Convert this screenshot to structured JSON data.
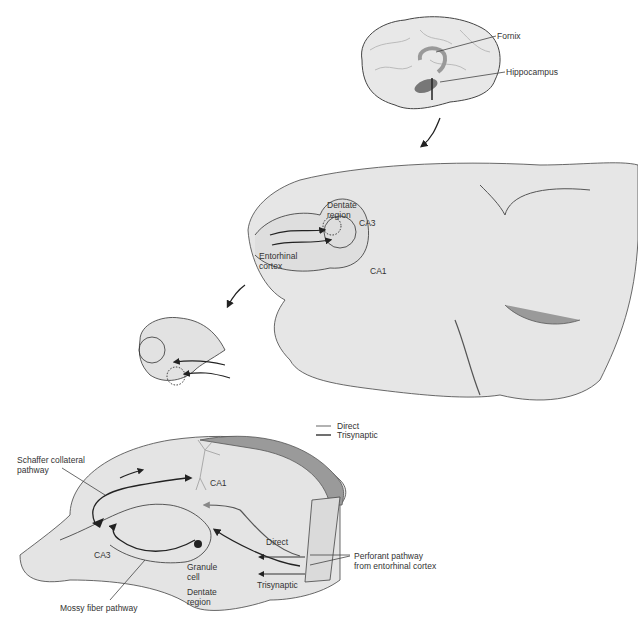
{
  "brain": {
    "labels": {
      "fornix": "Fornix",
      "hippocampus": "Hippocampus"
    }
  },
  "section": {
    "labels": {
      "dentate_region": [
        "Dentate",
        "region"
      ],
      "ca3": "CA3",
      "entorhinal_cortex": [
        "Entorhinal",
        "cortex"
      ],
      "ca1": "CA1"
    }
  },
  "legend": {
    "items": [
      {
        "label": "Direct",
        "color": "#888888"
      },
      {
        "label": "Trisynaptic",
        "color": "#222222"
      }
    ]
  },
  "circuit": {
    "labels": {
      "schaffer": [
        "Schaffer collateral",
        "pathway"
      ],
      "ca1": "CA1",
      "ca3": "CA3",
      "granule_cell": [
        "Granule",
        "cell"
      ],
      "dentate_region": [
        "Dentate",
        "region"
      ],
      "direct": "Direct",
      "trisynaptic": "Trisynaptic",
      "perforant": [
        "Perforant pathway",
        "from entorhinal cortex"
      ],
      "mossy": "Mossy fiber pathway"
    }
  },
  "colors": {
    "tissue_light": "#e6e6e6",
    "tissue_mid": "#d2d2d2",
    "tissue_dark": "#9a9a9a",
    "outline": "#333333",
    "direct_path": "#888888",
    "trisynaptic_path": "#222222"
  }
}
